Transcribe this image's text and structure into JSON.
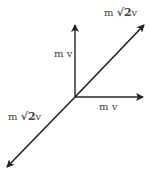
{
  "diagram": {
    "vectors": [
      {
        "id": "vertical",
        "label": "m v",
        "from": [
          75,
          97
        ],
        "to": [
          75,
          24
        ]
      },
      {
        "id": "horizontal",
        "label": "m v",
        "from": [
          75,
          97
        ],
        "to": [
          144,
          97
        ]
      },
      {
        "id": "diagonal-up",
        "label_prefix": "m ",
        "label_root": "√2",
        "label_suffix": "v",
        "from": [
          75,
          97
        ],
        "to": [
          145,
          24
        ]
      },
      {
        "id": "diagonal-down",
        "label_prefix": "m ",
        "label_root": "√2",
        "label_suffix": "v",
        "from": [
          75,
          97
        ],
        "to": [
          6,
          168
        ]
      }
    ],
    "stroke_color": "#222222"
  }
}
